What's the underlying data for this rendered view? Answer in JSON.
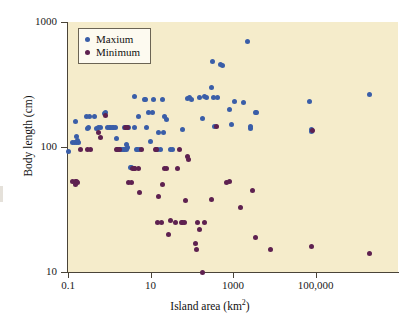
{
  "chart_data": {
    "type": "scatter",
    "title": "",
    "xlabel": "Island area (km2)",
    "xlabel_base": "Island area (km",
    "xlabel_sup": "2",
    "xlabel_tail": ")",
    "ylabel": "Body length (cm)",
    "xscale": "log",
    "yscale": "log",
    "xlim": [
      0.1,
      10000000
    ],
    "ylim": [
      10,
      1000
    ],
    "grid": false,
    "legend_position": "top-left",
    "xticks": [
      {
        "value": 0.1,
        "label": "0.1"
      },
      {
        "value": 10,
        "label": "10"
      },
      {
        "value": 1000,
        "label": "1000"
      },
      {
        "value": 100000,
        "label": "100,000"
      }
    ],
    "yticks": [
      {
        "value": 10,
        "label": "10"
      },
      {
        "value": 100,
        "label": "100"
      },
      {
        "value": 1000,
        "label": "1000"
      }
    ],
    "colors": {
      "maxium": "#3a5ea8",
      "minimum": "#5e2150",
      "plot_background": "#f5eccb",
      "axis": "#4a4438",
      "legend_background": "#fdfaf0",
      "legend_border": "#6b6454"
    },
    "series": [
      {
        "name": "Maxium",
        "color": "#3a5ea8",
        "points": [
          [
            0.1,
            92
          ],
          [
            0.13,
            108
          ],
          [
            0.14,
            108
          ],
          [
            0.16,
            108
          ],
          [
            0.18,
            108
          ],
          [
            0.15,
            160
          ],
          [
            0.16,
            122
          ],
          [
            0.17,
            112
          ],
          [
            0.28,
            176
          ],
          [
            0.3,
            140
          ],
          [
            0.32,
            142
          ],
          [
            0.34,
            175
          ],
          [
            0.45,
            175
          ],
          [
            0.5,
            140
          ],
          [
            0.55,
            142
          ],
          [
            0.6,
            143
          ],
          [
            0.75,
            185
          ],
          [
            0.8,
            188
          ],
          [
            0.9,
            142
          ],
          [
            1.0,
            143
          ],
          [
            1.1,
            143
          ],
          [
            1.2,
            143
          ],
          [
            1.3,
            143
          ],
          [
            1.45,
            143
          ],
          [
            1.5,
            118
          ],
          [
            1.6,
            95
          ],
          [
            1.7,
            95
          ],
          [
            1.8,
            95
          ],
          [
            1.9,
            95
          ],
          [
            2.0,
            95
          ],
          [
            2.2,
            95
          ],
          [
            2.4,
            95
          ],
          [
            2.6,
            95
          ],
          [
            2.3,
            143
          ],
          [
            2.5,
            143
          ],
          [
            2.8,
            143
          ],
          [
            3.0,
            143
          ],
          [
            3.2,
            68
          ],
          [
            3.4,
            68
          ],
          [
            2.6,
            104
          ],
          [
            2.8,
            100
          ],
          [
            4.0,
            252
          ],
          [
            4.2,
            143
          ],
          [
            4.5,
            95
          ],
          [
            4.8,
            95
          ],
          [
            5.0,
            175
          ],
          [
            5.5,
            95
          ],
          [
            7.0,
            240
          ],
          [
            7.5,
            238
          ],
          [
            8.0,
            143
          ],
          [
            9.0,
            190
          ],
          [
            10,
            110
          ],
          [
            11,
            190
          ],
          [
            12,
            240
          ],
          [
            14,
            95
          ],
          [
            15,
            95
          ],
          [
            16,
            130
          ],
          [
            17,
            95
          ],
          [
            20,
            240
          ],
          [
            21,
            130
          ],
          [
            22,
            175
          ],
          [
            24,
            165
          ],
          [
            30,
            95
          ],
          [
            35,
            95
          ],
          [
            60,
            138
          ],
          [
            80,
            245
          ],
          [
            90,
            248
          ],
          [
            100,
            240
          ],
          [
            150,
            250
          ],
          [
            180,
            170
          ],
          [
            200,
            253
          ],
          [
            230,
            250
          ],
          [
            300,
            300
          ],
          [
            320,
            480
          ],
          [
            330,
            250
          ],
          [
            350,
            145
          ],
          [
            420,
            250
          ],
          [
            500,
            455
          ],
          [
            560,
            450
          ],
          [
            800,
            200
          ],
          [
            900,
            150
          ],
          [
            1100,
            230
          ],
          [
            1800,
            225
          ],
          [
            2300,
            700
          ],
          [
            2600,
            140
          ],
          [
            2700,
            145
          ],
          [
            3500,
            190
          ],
          [
            3800,
            188
          ],
          [
            70000,
            230
          ],
          [
            80000,
            132
          ],
          [
            82000,
            138
          ],
          [
            2000000,
            265
          ]
        ]
      },
      {
        "name": "Minimum",
        "color": "#5e2150",
        "points": [
          [
            0.13,
            53
          ],
          [
            0.15,
            53
          ],
          [
            0.16,
            53
          ],
          [
            0.17,
            52
          ],
          [
            0.15,
            50
          ],
          [
            0.2,
            95
          ],
          [
            0.3,
            95
          ],
          [
            0.35,
            95
          ],
          [
            0.55,
            130
          ],
          [
            0.6,
            120
          ],
          [
            0.8,
            178
          ],
          [
            1.5,
            95
          ],
          [
            1.6,
            95
          ],
          [
            1.8,
            95
          ],
          [
            2.5,
            143
          ],
          [
            2.8,
            143
          ],
          [
            3.0,
            52
          ],
          [
            3.5,
            52
          ],
          [
            3.6,
            67
          ],
          [
            4.0,
            67
          ],
          [
            4.2,
            67
          ],
          [
            5.0,
            67
          ],
          [
            5.5,
            43
          ],
          [
            6.0,
            95
          ],
          [
            13,
            95
          ],
          [
            14,
            95
          ],
          [
            15,
            25
          ],
          [
            16,
            40
          ],
          [
            18,
            25
          ],
          [
            20,
            50
          ],
          [
            22,
            67
          ],
          [
            24,
            67
          ],
          [
            28,
            20
          ],
          [
            30,
            26
          ],
          [
            40,
            25
          ],
          [
            45,
            67
          ],
          [
            50,
            95
          ],
          [
            55,
            25
          ],
          [
            60,
            25
          ],
          [
            65,
            25
          ],
          [
            70,
            37
          ],
          [
            80,
            84
          ],
          [
            85,
            80
          ],
          [
            120,
            17
          ],
          [
            130,
            15
          ],
          [
            140,
            25
          ],
          [
            150,
            22
          ],
          [
            180,
            10
          ],
          [
            200,
            25
          ],
          [
            300,
            38
          ],
          [
            400,
            145
          ],
          [
            700,
            52
          ],
          [
            800,
            53
          ],
          [
            1500,
            33
          ],
          [
            3000,
            45
          ],
          [
            3500,
            19
          ],
          [
            8000,
            15
          ],
          [
            80000,
            16
          ],
          [
            85000,
            135
          ],
          [
            2000000,
            14
          ]
        ]
      }
    ]
  },
  "legend": {
    "items": [
      {
        "label": "Maxium",
        "marker": "maxium-dot",
        "color": "#3a5ea8"
      },
      {
        "label": "Minimum",
        "marker": "minimum-dot",
        "color": "#5e2150"
      }
    ]
  }
}
